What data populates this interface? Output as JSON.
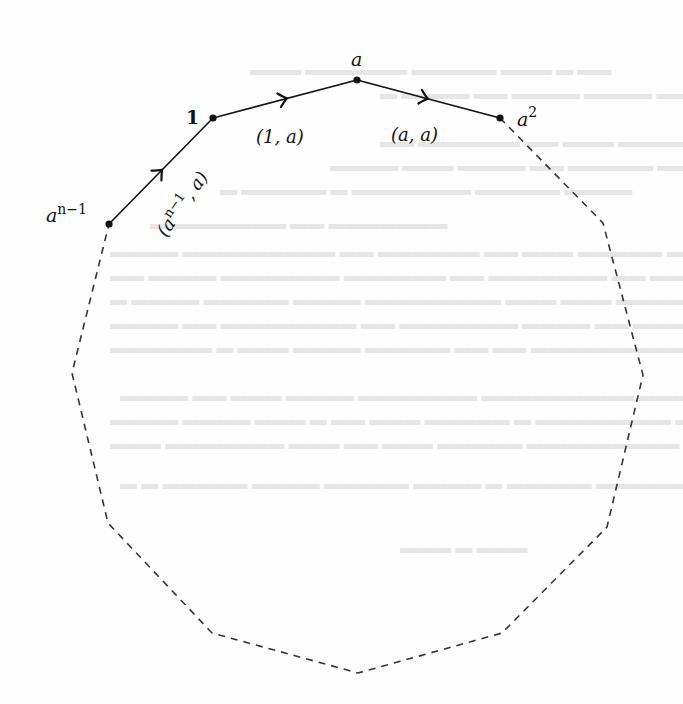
{
  "figure": {
    "colors": {
      "ink": "#111111",
      "background": "#fefefe",
      "dashed": "#333333"
    },
    "vertices": [
      {
        "id": "v_an1",
        "label": "a",
        "sup": "n−1",
        "x": 109,
        "y": 224
      },
      {
        "id": "v_1",
        "label": "1",
        "sup": "",
        "x": 213,
        "y": 118
      },
      {
        "id": "v_a",
        "label": "a",
        "sup": "",
        "x": 357,
        "y": 80
      },
      {
        "id": "v_a2",
        "label": "a",
        "sup": "2",
        "x": 500,
        "y": 118
      }
    ],
    "solid_edges": [
      {
        "from": "v_an1",
        "to": "v_1",
        "label": "(aⁿ⁻¹, a)",
        "label_text": "a",
        "label_sup": "n−1",
        "arrow_at": [
          160,
          175
        ]
      },
      {
        "from": "v_1",
        "to": "v_a",
        "label": "(1, a)",
        "arrow_at": [
          283,
          100
        ]
      },
      {
        "from": "v_a",
        "to": "v_a2",
        "label": "(a, a)",
        "arrow_at": [
          424,
          102
        ]
      }
    ],
    "dashed_path_points": [
      [
        500,
        118
      ],
      [
        603,
        223
      ],
      [
        643,
        375
      ],
      [
        607,
        527
      ],
      [
        502,
        633
      ],
      [
        358,
        673
      ],
      [
        212,
        633
      ],
      [
        108,
        523
      ],
      [
        72,
        373
      ],
      [
        109,
        224
      ]
    ],
    "labels": {
      "v_an1_base": "a",
      "v_an1_sup": "n−1",
      "v_1": "1",
      "v_a": "a",
      "v_a2_base": "a",
      "v_a2_sup": "2",
      "edge_1_a": "(1, a)",
      "edge_a_a": "(a, a)",
      "edge_an1_open": "(",
      "edge_an1_base": "a",
      "edge_an1_sup": "n−1",
      "edge_an1_tail": ", a)"
    }
  }
}
